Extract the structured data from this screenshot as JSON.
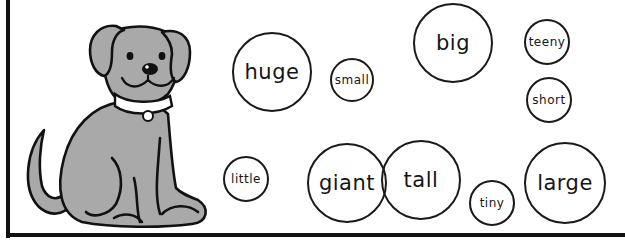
{
  "worksheet": {
    "picture": {
      "subject": "dog",
      "icon": "dog-illustration",
      "colors": {
        "fur": "#a9a9a9",
        "outline": "#111111",
        "collar": "#ffffff"
      }
    },
    "words": [
      {
        "label": "huge",
        "size": "large",
        "cx": 272,
        "cy": 72,
        "r": 40
      },
      {
        "label": "small",
        "size": "small",
        "cx": 352,
        "cy": 80,
        "r": 22
      },
      {
        "label": "big",
        "size": "large",
        "cx": 453,
        "cy": 43,
        "r": 40
      },
      {
        "label": "teeny",
        "size": "small",
        "cx": 547,
        "cy": 42,
        "r": 23
      },
      {
        "label": "short",
        "size": "small",
        "cx": 549,
        "cy": 100,
        "r": 23
      },
      {
        "label": "little",
        "size": "small",
        "cx": 246,
        "cy": 179,
        "r": 23
      },
      {
        "label": "giant",
        "size": "large",
        "cx": 347,
        "cy": 183,
        "r": 40
      },
      {
        "label": "tall",
        "size": "large",
        "cx": 421,
        "cy": 180,
        "r": 40
      },
      {
        "label": "tiny",
        "size": "small",
        "cx": 492,
        "cy": 203,
        "r": 23
      },
      {
        "label": "large",
        "size": "large",
        "cx": 565,
        "cy": 183,
        "r": 41
      }
    ]
  }
}
